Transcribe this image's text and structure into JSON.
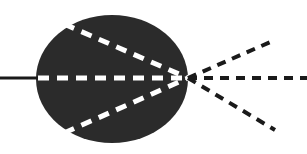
{
  "figure": {
    "width": 307,
    "height": 154,
    "background_color": "#ffffff"
  },
  "colors": {
    "medium_fill": "#2b2b2b",
    "internal_ray": "#ffffff",
    "external_ray": "#1a1a1a",
    "incident_ray": "#1a1a1a",
    "background": "#ffffff"
  },
  "chart_data": {
    "type": "diagram",
    "xlabel": "",
    "ylabel": "",
    "xlim": [
      0,
      307
    ],
    "ylim": [
      0,
      154
    ],
    "grid": false,
    "legend": "none",
    "annotations": [],
    "focal_point": {
      "x": 188,
      "y": 78
    },
    "medium": {
      "shape": "circle",
      "center_x": 112,
      "center_y": 79,
      "radius_x": 76,
      "radius_y": 64,
      "fill": "#2b2b2b",
      "label": "dark medium"
    },
    "series": [
      {
        "name": "incident-ray",
        "style": "solid",
        "color": "#1a1a1a",
        "width": 3,
        "points": [
          {
            "x": 0,
            "y": 78
          },
          {
            "x": 40,
            "y": 78
          }
        ]
      },
      {
        "name": "internal-ray-axis",
        "style": "dashed",
        "color": "#ffffff",
        "width": 5,
        "points": [
          {
            "x": 38,
            "y": 78
          },
          {
            "x": 188,
            "y": 78
          }
        ]
      },
      {
        "name": "internal-ray-upper",
        "style": "dashed",
        "color": "#ffffff",
        "width": 5,
        "points": [
          {
            "x": 64,
            "y": 24
          },
          {
            "x": 188,
            "y": 78
          }
        ]
      },
      {
        "name": "internal-ray-lower",
        "style": "dashed",
        "color": "#ffffff",
        "width": 5,
        "points": [
          {
            "x": 64,
            "y": 133
          },
          {
            "x": 188,
            "y": 78
          }
        ]
      },
      {
        "name": "emergent-ray-axis",
        "style": "dashed",
        "color": "#1a1a1a",
        "width": 4,
        "points": [
          {
            "x": 188,
            "y": 78
          },
          {
            "x": 307,
            "y": 78
          }
        ]
      },
      {
        "name": "emergent-ray-upper",
        "style": "dashed",
        "color": "#1a1a1a",
        "width": 4,
        "points": [
          {
            "x": 188,
            "y": 78
          },
          {
            "x": 275,
            "y": 40
          }
        ]
      },
      {
        "name": "emergent-ray-lower",
        "style": "dashed",
        "color": "#1a1a1a",
        "width": 4,
        "points": [
          {
            "x": 188,
            "y": 78
          },
          {
            "x": 275,
            "y": 130
          }
        ]
      }
    ]
  }
}
